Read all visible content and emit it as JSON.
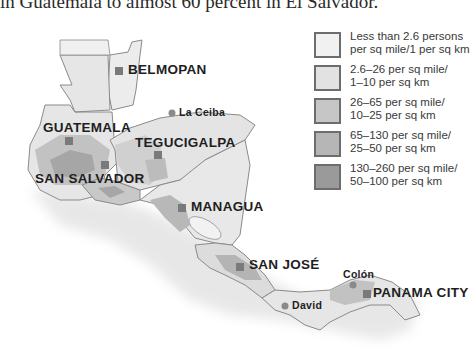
{
  "caption": "in Guatemala to almost 60 percent in El Salvador.",
  "legend": {
    "items": [
      {
        "line1": "Less than 2.6 persons",
        "line2": "per sq mile/1 per sq km",
        "color": "#f1f1f1"
      },
      {
        "line1": "2.6–26 per sq mile/",
        "line2": "1–10 per sq km",
        "color": "#e2e2e2"
      },
      {
        "line1": "26–65 per sq mile/",
        "line2": "10–25 per sq km",
        "color": "#c6c6c6"
      },
      {
        "line1": "65–130 per sq mile/",
        "line2": "25–50 per sq km",
        "color": "#b6b6b6"
      },
      {
        "line1": "130–260 per sq mile/",
        "line2": "50–100 per sq km",
        "color": "#9a9a9a"
      }
    ]
  },
  "map": {
    "capitals": [
      {
        "name": "BELMOPAN"
      },
      {
        "name": "GUATEMALA"
      },
      {
        "name": "TEGUCIGALPA"
      },
      {
        "name": "SAN SALVADOR"
      },
      {
        "name": "MANAGUA"
      },
      {
        "name": "SAN JOSÉ"
      },
      {
        "name": "PANAMA CITY"
      }
    ],
    "cities": [
      {
        "name": "La Ceiba"
      },
      {
        "name": "Colón"
      },
      {
        "name": "David"
      }
    ],
    "colors": {
      "land_base": "#e8e8e8",
      "border": "#8a8a8a",
      "capital_marker": "#7a7a7a",
      "city_marker": "#8a8a8a"
    }
  }
}
